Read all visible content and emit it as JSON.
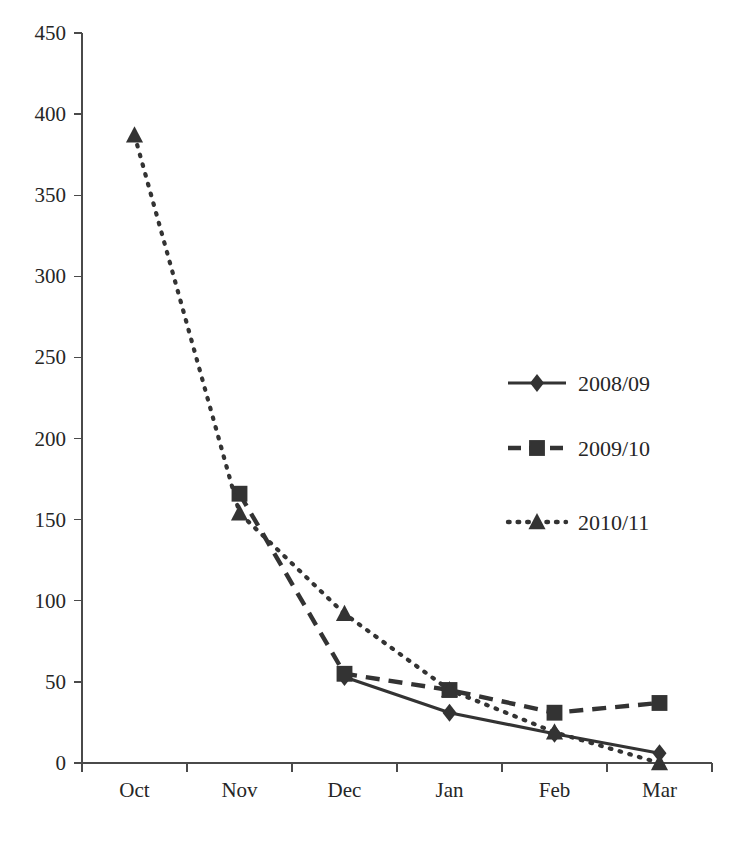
{
  "chart_data": {
    "type": "line",
    "title": "",
    "subtitle": "",
    "xlabel": "",
    "ylabel": "",
    "categories": [
      "Oct",
      "Nov",
      "Dec",
      "Jan",
      "Feb",
      "Mar"
    ],
    "ylim": [
      0,
      450
    ],
    "ytick_labels": [
      "0",
      "50",
      "100",
      "150",
      "200",
      "250",
      "300",
      "350",
      "400",
      "450"
    ],
    "yticks": [
      0,
      50,
      100,
      150,
      200,
      250,
      300,
      350,
      400,
      450
    ],
    "grid": false,
    "legend_position": "center-right",
    "line_color": "#333333",
    "axis_color": "#4a4a4a",
    "series": [
      {
        "name": "2008/09",
        "style": "solid",
        "marker": "diamond",
        "values": [
          null,
          null,
          53,
          31,
          18,
          6
        ]
      },
      {
        "name": "2009/10",
        "style": "dashed",
        "marker": "square",
        "values": [
          null,
          166,
          55,
          45,
          31,
          37
        ]
      },
      {
        "name": "2010/11",
        "style": "dotted",
        "marker": "triangle",
        "values": [
          387,
          154,
          92,
          45,
          19,
          0
        ]
      }
    ]
  },
  "legend": {
    "entries": [
      {
        "label": "2008/09"
      },
      {
        "label": "2009/10"
      },
      {
        "label": "2010/11"
      }
    ]
  }
}
